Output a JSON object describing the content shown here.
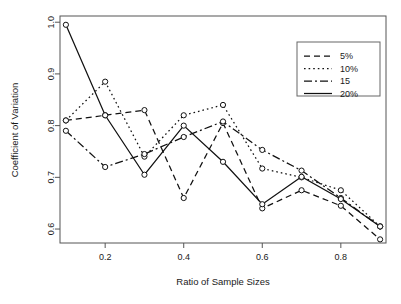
{
  "chart_data": {
    "type": "line",
    "title": "",
    "xlabel": "Ratio of Sample Sizes",
    "ylabel": "Coefficient of Variation",
    "x": [
      0.1,
      0.2,
      0.3,
      0.4,
      0.5,
      0.6,
      0.7,
      0.8,
      0.9
    ],
    "xlim": [
      0.085,
      0.915
    ],
    "ylim": [
      0.573,
      1.012
    ],
    "xticks": [
      0.2,
      0.4,
      0.6,
      0.8
    ],
    "xtick_labels": [
      "0.2",
      "0.4",
      "0.6",
      "0.8"
    ],
    "yticks": [
      0.6,
      0.7,
      0.8,
      0.9,
      1.0
    ],
    "ytick_labels": [
      "0.6",
      "0.7",
      "0.8",
      "0.9",
      "1.0"
    ],
    "grid": false,
    "legend_position": "top-right",
    "marker": "open-circle",
    "series": [
      {
        "name": "5%",
        "linestyle": "dashed",
        "dash": "6,4",
        "values": [
          0.81,
          0.82,
          0.83,
          0.66,
          0.805,
          0.64,
          0.675,
          0.645,
          0.58
        ]
      },
      {
        "name": "10%",
        "linestyle": "dotted",
        "dash": "1.6,3",
        "values": [
          0.81,
          0.885,
          0.74,
          0.82,
          0.84,
          0.717,
          0.7,
          0.675,
          0.605
        ]
      },
      {
        "name": "15",
        "linestyle": "dashdot",
        "dash": "8,3,2,3",
        "values": [
          0.79,
          0.72,
          0.745,
          0.778,
          0.808,
          0.753,
          0.713,
          0.66,
          0.605
        ]
      },
      {
        "name": "20%",
        "linestyle": "solid",
        "dash": "",
        "values": [
          0.995,
          0.82,
          0.705,
          0.8,
          0.73,
          0.648,
          0.701,
          0.658,
          0.605
        ]
      }
    ]
  },
  "legend": {
    "entries": [
      {
        "label": "5%"
      },
      {
        "label": "10%"
      },
      {
        "label": "15"
      },
      {
        "label": "20%"
      }
    ]
  },
  "colors": {
    "background": "#ffffff",
    "ink": "#111111",
    "frame": "#555555"
  }
}
